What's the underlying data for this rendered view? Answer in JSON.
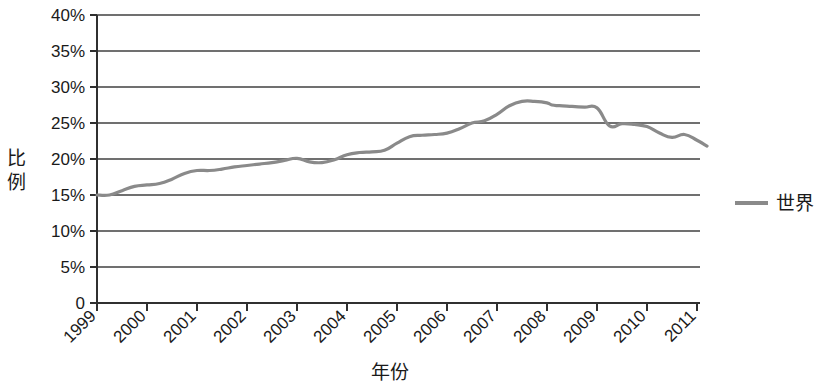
{
  "chart_data": {
    "type": "line",
    "title": "",
    "xlabel": "年份",
    "ylabel": "比例",
    "xlim": [
      1999,
      2011.5
    ],
    "ylim": [
      0,
      40
    ],
    "grid": true,
    "legend_position": "right",
    "y_tick_labels": [
      "40%",
      "35%",
      "30%",
      "25%",
      "20%",
      "15%",
      "10%",
      "5%",
      "0"
    ],
    "y_tick_values": [
      40,
      35,
      30,
      25,
      20,
      15,
      10,
      5,
      0
    ],
    "x_tick_labels": [
      "1999",
      "2000",
      "2001",
      "2002",
      "2003",
      "2004",
      "2005",
      "2006",
      "2007",
      "2008",
      "2009",
      "2010",
      "2011"
    ],
    "x_tick_values": [
      1999,
      2000,
      2001,
      2002,
      2003,
      2004,
      2005,
      2006,
      2007,
      2008,
      2009,
      2010,
      2011
    ],
    "series": [
      {
        "name": "世界",
        "color": "#8a8a8a",
        "x": [
          1999.0,
          1999.25,
          1999.5,
          1999.75,
          2000.0,
          2000.25,
          2000.5,
          2000.75,
          2001.0,
          2001.25,
          2001.5,
          2001.75,
          2002.0,
          2002.25,
          2002.5,
          2002.75,
          2003.0,
          2003.25,
          2003.5,
          2003.75,
          2004.0,
          2004.25,
          2004.5,
          2004.75,
          2005.0,
          2005.25,
          2005.5,
          2005.75,
          2006.0,
          2006.25,
          2006.5,
          2006.75,
          2007.0,
          2007.25,
          2007.5,
          2007.75,
          2008.0,
          2008.1,
          2008.25,
          2008.5,
          2008.75,
          2009.0,
          2009.25,
          2009.5,
          2009.75,
          2010.0,
          2010.25,
          2010.5,
          2010.75,
          2011.0,
          2011.2
        ],
        "y": [
          15.0,
          15.0,
          15.6,
          16.2,
          16.4,
          16.6,
          17.2,
          18.0,
          18.4,
          18.4,
          18.6,
          18.9,
          19.1,
          19.3,
          19.5,
          19.8,
          20.1,
          19.6,
          19.5,
          19.9,
          20.6,
          20.9,
          21.0,
          21.2,
          22.2,
          23.1,
          23.3,
          23.4,
          23.6,
          24.2,
          25.0,
          25.3,
          26.2,
          27.4,
          28.0,
          28.0,
          27.8,
          27.5,
          27.4,
          27.3,
          27.2,
          27.1,
          24.6,
          24.9,
          24.8,
          24.5,
          23.6,
          23.0,
          23.4,
          22.6,
          21.8
        ],
        "start_value": 15.0,
        "peak_value": 28.0,
        "peak_year": 2007.5,
        "end_value": 21.8
      }
    ],
    "legend": [
      {
        "label": "世界",
        "color": "#8a8a8a"
      }
    ],
    "ylabel_chars": [
      "比",
      "例"
    ]
  },
  "colors": {
    "line": "#8a8a8a",
    "axis": "#303030",
    "grid": "#404040",
    "background": "#ffffff",
    "text": "#1a1a1a"
  }
}
